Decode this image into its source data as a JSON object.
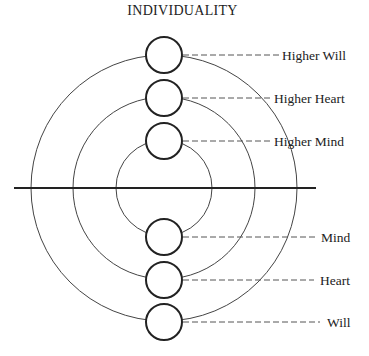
{
  "title": "INDIVIDUALITY",
  "colors": {
    "stroke": "#222222",
    "thin_stroke": "#444444",
    "dash": "#555555",
    "background": "#ffffff"
  },
  "divider": {
    "x1": 14,
    "x2": 316,
    "y": 188
  },
  "center": {
    "x": 164,
    "y": 188
  },
  "rings": [
    {
      "name": "outer-ring",
      "r": 133
    },
    {
      "name": "middle-ring",
      "r": 91
    },
    {
      "name": "inner-ring",
      "r": 48
    }
  ],
  "nodes": [
    {
      "id": "higher-will",
      "label": "Higher Will",
      "cy": 55,
      "dash_end": 280,
      "label_x": 282
    },
    {
      "id": "higher-heart",
      "label": "Higher Heart",
      "cy": 98,
      "dash_end": 270,
      "label_x": 274
    },
    {
      "id": "higher-mind",
      "label": "Higher Mind",
      "cy": 141,
      "dash_end": 270,
      "label_x": 274
    },
    {
      "id": "mind",
      "label": "Mind",
      "cy": 237,
      "dash_end": 318,
      "label_x": 321
    },
    {
      "id": "heart",
      "label": "Heart",
      "cy": 280,
      "dash_end": 314,
      "label_x": 320
    },
    {
      "id": "will",
      "label": "Will",
      "cy": 322,
      "dash_end": 320,
      "label_x": 327
    }
  ],
  "node_radius": 18
}
